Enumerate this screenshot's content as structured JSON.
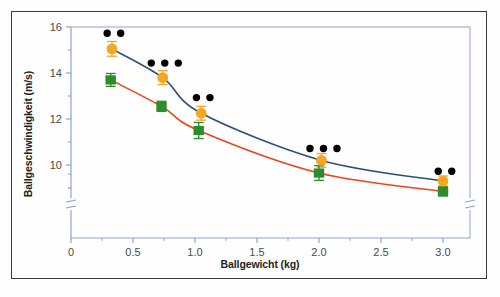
{
  "figure": {
    "background_color": "#fefefe",
    "frame_color": "#3a3a3c",
    "axis_color": "#8ea4c8"
  },
  "chart_data": {
    "type": "scatter",
    "title": "",
    "xlabel": "Ballgewicht (kg)",
    "ylabel": "Ballgeschwindigkeit (m/s)",
    "xlim": [
      0,
      3.25
    ],
    "ylim": [
      8.3,
      16
    ],
    "xticks": [
      0,
      0.5,
      1.0,
      1.5,
      2.0,
      2.5,
      3.0
    ],
    "xticklabels": [
      "0",
      "0.5",
      "1.0",
      "1.5",
      "2.0",
      "2.5",
      "3.0"
    ],
    "yticks": [
      10,
      12,
      14,
      16
    ],
    "yticklabels": [
      "10",
      "12",
      "14",
      "16"
    ],
    "y_minor_ticks": [
      9,
      11,
      13,
      15
    ],
    "y_axis_break": true,
    "grid": false,
    "legend": "none",
    "series": [
      {
        "name": "orange-series",
        "marker": "circle",
        "marker_color": "#F5A623",
        "line_color": "#2e4d7b",
        "x": [
          0.33,
          0.74,
          1.05,
          2.02,
          3.0
        ],
        "y": [
          15.05,
          13.8,
          12.25,
          10.2,
          9.3
        ],
        "yerr": [
          0.32,
          0.3,
          0.3,
          0.3,
          0.22
        ]
      },
      {
        "name": "green-series",
        "marker": "square",
        "marker_color": "#2E8B2E",
        "line_color": "#e8471f",
        "x": [
          0.32,
          0.73,
          1.03,
          2.0,
          3.0
        ],
        "y": [
          13.7,
          12.55,
          11.5,
          9.65,
          8.85
        ],
        "yerr": [
          0.28,
          0.22,
          0.35,
          0.32,
          0.2
        ]
      }
    ],
    "significance_markers": {
      "symbol": "●",
      "color": "#000000",
      "groups": [
        {
          "x": 0.33,
          "y": 15.73,
          "count": 2
        },
        {
          "x": 0.74,
          "y": 14.43,
          "count": 3
        },
        {
          "x": 1.05,
          "y": 12.93,
          "count": 2
        },
        {
          "x": 2.02,
          "y": 10.72,
          "count": 3
        },
        {
          "x": 3.0,
          "y": 9.73,
          "count": 2
        }
      ]
    }
  }
}
